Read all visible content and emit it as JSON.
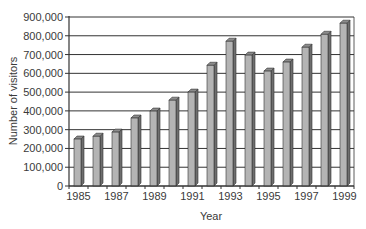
{
  "chart_data": {
    "type": "bar",
    "title": "",
    "xlabel": "Year",
    "ylabel": "Number of visitors",
    "categories": [
      "1985",
      "1986",
      "1987",
      "1988",
      "1989",
      "1990",
      "1991",
      "1992",
      "1993",
      "1994",
      "1995",
      "1996",
      "1997",
      "1998",
      "1999"
    ],
    "x_tick_labels": [
      "1985",
      "1987",
      "1989",
      "1991",
      "1993",
      "1995",
      "1997",
      "1999"
    ],
    "values": [
      250000,
      265000,
      287000,
      362000,
      399000,
      457000,
      500000,
      643000,
      771000,
      697000,
      612000,
      660000,
      739000,
      808000,
      867000
    ],
    "ylim": [
      0,
      900000
    ],
    "y_ticks": [
      0,
      100000,
      200000,
      300000,
      400000,
      500000,
      600000,
      700000,
      800000,
      900000
    ],
    "y_tick_labels": [
      "0",
      "100,000",
      "200,000",
      "300,000",
      "400,000",
      "500,000",
      "600,000",
      "700,000",
      "800,000",
      "900,000"
    ],
    "grid": true,
    "legend": null,
    "style": "3d-bar",
    "colors": {
      "bar_front": "#b4b4b4",
      "bar_side": "#6e6e6e",
      "bar_top": "#8c8c8c",
      "grid": "#333333",
      "axis": "#333333"
    }
  }
}
